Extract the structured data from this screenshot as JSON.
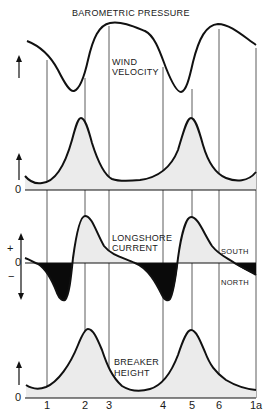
{
  "title": "BAROMETRIC PRESSURE",
  "panels": {
    "wind": {
      "label_line1": "WIND",
      "label_line2": "VELOCITY",
      "zero": "0"
    },
    "longshore": {
      "label_line1": "LONGSHORE",
      "label_line2": "CURRENT",
      "plus": "+",
      "zero": "0",
      "minus": "−",
      "south": "SOUTH",
      "north": "NORTH"
    },
    "breaker": {
      "label_line1": "BREAKER",
      "label_line2": "HEIGHT",
      "zero": "0"
    }
  },
  "x_ticks": [
    "1",
    "2",
    "3",
    "4",
    "5",
    "6",
    "1a"
  ],
  "colors": {
    "line": "#111111",
    "fill_positive": "#ebebeb",
    "fill_negative": "#0a0a0a",
    "grid": "#333333"
  }
}
